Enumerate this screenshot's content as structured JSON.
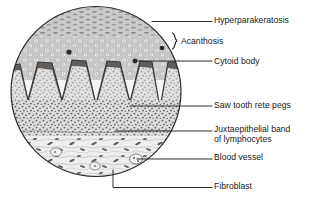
{
  "figure": {
    "kind": "histology-diagram",
    "shape": "circle",
    "line_color": "#1a1c1e",
    "ink_color": "#16181a",
    "background": "#ffffff"
  },
  "labels": {
    "hyperparakeratosis": "Hyperparakeratosis",
    "acanthosis": "Acanthosis",
    "cytoid_body": "Cytoid body",
    "saw_tooth_rete_pegs": "Saw tooth rete pegs",
    "juxtaepithelial_line1": "Juxtaepithelial band",
    "juxtaepithelial_line2": "of lymphocytes",
    "blood_vessel": "Blood vessel",
    "fibroblast": "Fibroblast"
  },
  "layers": [
    {
      "name": "parakeratin-layer",
      "description": "hyperparakeratotic surface keratin with retained flattened nuclei"
    },
    {
      "name": "spinous-layer",
      "description": "acanthotic thickened spinous layer of vacuolated keratinocytes"
    },
    {
      "name": "basal-zone",
      "description": "dark saw-tooth shaped rete pegs at epithelial-connective tissue junction"
    },
    {
      "name": "lamina-propria",
      "description": "dense juxtaepithelial band of lymphocytes"
    },
    {
      "name": "deep-connective-tissue",
      "description": "collagen bundles with fibroblasts and blood vessels"
    }
  ]
}
